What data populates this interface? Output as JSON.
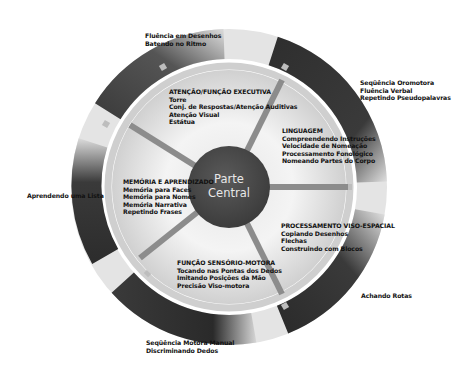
{
  "diagram": {
    "center": {
      "line1": "Parte",
      "line2": "Central"
    },
    "domains": [
      {
        "id": "attention",
        "title": "ATENÇÃO/FUNÇÃO EXECUTIVA",
        "items": [
          "Torre",
          "Conj. de Respostas/Atenção Auditivas",
          "Atenção Visual",
          "Estátua"
        ]
      },
      {
        "id": "language",
        "title": "LINGUAGEM",
        "items": [
          "Compreendendo Instruções",
          "Velocidade de Nomeação",
          "Processamento Fonológico",
          "Nomeando Partes do Corpo"
        ]
      },
      {
        "id": "visuospatial",
        "title": "PROCESSAMENTO VISO-ESPACIAL",
        "items": [
          "Copiando Desenhos",
          "Flechas",
          "Construindo com Blocos"
        ]
      },
      {
        "id": "sensorimotor",
        "title": "FUNÇÃO SENSÓRIO-MOTORA",
        "items": [
          "Tocando nas Pontas dos Dedos",
          "Imitando Posições da Mão",
          "Precisão Viso-motora"
        ]
      },
      {
        "id": "memory",
        "title": "MEMÓRIA E APRENDIZADO",
        "items": [
          "Memória para Faces",
          "Memória para Nomes",
          "Memória Narrativa",
          "Repetindo Frases"
        ]
      }
    ],
    "outer_labels": {
      "top_left": [
        "Fluência em Desenhos",
        "Batendo no Ritmo"
      ],
      "top_right": [
        "Seqüência Oromotora",
        "Fluência Verbal",
        "Repetindo Pseudopalavras"
      ],
      "left": [
        "Aprendendo uma Lista"
      ],
      "bottom_right": [
        "Achando Rotas"
      ],
      "bottom_left": [
        "Seqüência Motora Manual",
        "Discriminando Dedos"
      ]
    },
    "colors": {
      "arc_dark": "#2a2a2a",
      "arc_light": "#d8d8d8",
      "disc_light": "#f2f2f2",
      "disc_shade": "#c9c9c9",
      "ring": "#c4c4c4",
      "center": "#4a4a4a",
      "spoke": "#8a8a8a",
      "text": "#111111",
      "center_text": "#e8e8e8"
    }
  }
}
